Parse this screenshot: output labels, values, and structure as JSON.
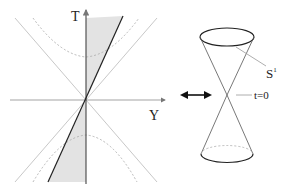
{
  "left_diagram": {
    "axis_t_label": "T",
    "axis_y_label": "Y"
  },
  "right_diagram": {
    "circle_label": "S",
    "circle_label_sup": "1",
    "vertex_label": "t=0"
  },
  "colors": {
    "axis": "#555555",
    "light_line": "#c8c8c8",
    "dark_line": "#222222",
    "shade": "#e3e3e3",
    "dashed": "#b0b0b0"
  }
}
